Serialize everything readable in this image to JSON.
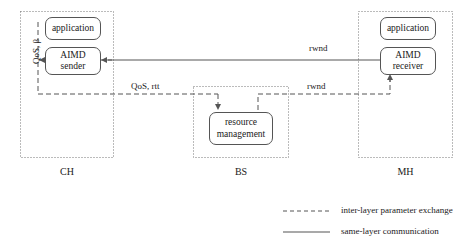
{
  "diagram": {
    "colors": {
      "stroke": "#555555",
      "text": "#1a1a1a",
      "background": "#ffffff"
    },
    "containers": [
      {
        "id": "ch",
        "label": "CH"
      },
      {
        "id": "bs",
        "label": "BS"
      },
      {
        "id": "mh",
        "label": "MH"
      }
    ],
    "nodes": [
      {
        "id": "ch-application",
        "line1": "application",
        "line2": ""
      },
      {
        "id": "ch-aimd-sender",
        "line1": "AIMD",
        "line2": "sender"
      },
      {
        "id": "bs-resource-management",
        "line1": "resource",
        "line2": "management"
      },
      {
        "id": "mh-application",
        "line1": "application",
        "line2": ""
      },
      {
        "id": "mh-aimd-receiver",
        "line1": "AIMD",
        "line2": "receiver"
      }
    ],
    "edge_labels": {
      "qos_beta": "QoS, β",
      "qos_rtt": "QoS, rtt",
      "rwnd_top": "rwnd",
      "rwnd_bottom": "rwnd"
    },
    "legend": [
      {
        "id": "inter-layer",
        "style": "dashed",
        "label": "inter-layer parameter exchange"
      },
      {
        "id": "same-layer",
        "style": "solid",
        "label": "same-layer communication"
      }
    ]
  }
}
